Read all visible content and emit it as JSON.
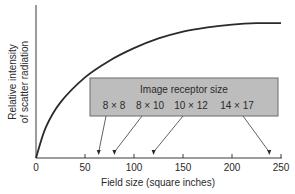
{
  "chart_data": {
    "type": "line",
    "title": "",
    "xlabel": "Field size (square inches)",
    "ylabel_line1": "Relative intensity",
    "ylabel_line2": "of scatter radiation",
    "xlim": [
      0,
      250
    ],
    "ylim": [
      0,
      1
    ],
    "x_ticks": [
      0,
      50,
      100,
      150,
      200,
      250
    ],
    "x_tick_labels": [
      "0",
      "50",
      "100",
      "150",
      "200",
      "250"
    ],
    "y_ticks": [],
    "grid": false,
    "series": [
      {
        "name": "Relative intensity of scatter radiation",
        "x": [
          0,
          10,
          25,
          50,
          75,
          100,
          125,
          150,
          175,
          200,
          225,
          250
        ],
        "y": [
          0.0,
          0.22,
          0.4,
          0.58,
          0.7,
          0.79,
          0.86,
          0.91,
          0.94,
          0.96,
          0.97,
          0.97
        ]
      }
    ],
    "annotation": {
      "title": "Image receptor size",
      "items": [
        {
          "label": "8 × 8",
          "x": 64
        },
        {
          "label": "8 × 10",
          "x": 80
        },
        {
          "label": "10 × 12",
          "x": 120
        },
        {
          "label": "14 × 17",
          "x": 238
        }
      ]
    }
  },
  "colors": {
    "curve": "#2a2a2a",
    "axis": "#3a3a3a",
    "box_fill": "#bdbdbd",
    "box_border": "#6a6a6a",
    "text": "#2a2a2a"
  }
}
